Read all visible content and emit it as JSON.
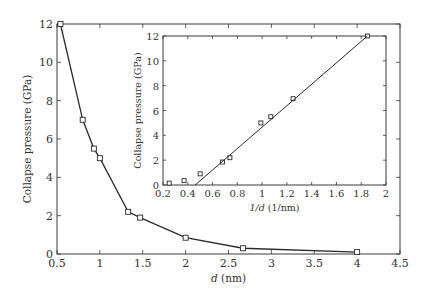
{
  "chart_data": [
    {
      "id": "main",
      "type": "line",
      "title": "",
      "xlabel_italic": "d",
      "xlabel_rest": " (nm)",
      "ylabel": "Collapse pressure (GPa)",
      "xlim": [
        0.5,
        4.5
      ],
      "ylim": [
        0,
        12
      ],
      "xticks": [
        0.5,
        1,
        1.5,
        2,
        2.5,
        3,
        3.5,
        4,
        4.5
      ],
      "xtick_labels": [
        "0.5",
        "1",
        "1.5",
        "2",
        "2.5",
        "3",
        "3.5",
        "4",
        "4.5"
      ],
      "yticks": [
        0,
        2,
        4,
        6,
        8,
        10,
        12
      ],
      "ytick_labels": [
        "0",
        "2",
        "4",
        "6",
        "8",
        "10",
        "12"
      ],
      "grid": false,
      "marker": "square",
      "series": [
        {
          "name": "Collapse pressure vs d",
          "x": [
            0.54,
            0.8,
            0.93,
            1.0,
            1.33,
            1.47,
            2.0,
            2.67,
            4.0
          ],
          "y": [
            12.0,
            7.0,
            5.5,
            5.0,
            2.2,
            1.9,
            0.85,
            0.3,
            0.1
          ]
        }
      ]
    },
    {
      "id": "inset",
      "type": "scatter",
      "title": "",
      "xlabel_italic": "1/d",
      "xlabel_rest": " (1/nm)",
      "ylabel": "Collapse pressure (GPa)",
      "xlim": [
        0.2,
        2.0
      ],
      "ylim": [
        0,
        12
      ],
      "xticks": [
        0.2,
        0.4,
        0.6,
        0.8,
        1.0,
        1.2,
        1.4,
        1.6,
        1.8,
        2.0
      ],
      "xtick_labels": [
        "0.2",
        "0.4",
        "0.6",
        "0.8",
        "1",
        "1.2",
        "1.4",
        "1.6",
        "1.8",
        "2"
      ],
      "yticks": [
        0,
        2,
        4,
        6,
        8,
        10,
        12
      ],
      "ytick_labels": [
        "0",
        "2",
        "4",
        "6",
        "8",
        "10",
        "12"
      ],
      "grid": false,
      "marker": "square",
      "series": [
        {
          "name": "Data",
          "x": [
            0.25,
            0.37,
            0.5,
            0.68,
            0.74,
            0.99,
            1.07,
            1.25,
            1.85
          ],
          "y": [
            0.15,
            0.35,
            0.9,
            1.85,
            2.2,
            5.0,
            5.5,
            6.95,
            12.0
          ]
        },
        {
          "name": "Linear fit",
          "type": "line",
          "x": [
            0.46,
            1.85
          ],
          "y": [
            0.0,
            12.0
          ]
        }
      ]
    }
  ]
}
